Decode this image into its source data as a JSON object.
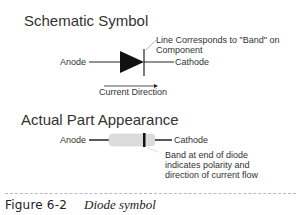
{
  "schematic": {
    "title": "Schematic Symbol",
    "anode_label": "Anode",
    "cathode_label": "Cathode",
    "band_note_line1": "Line Corresponds to \"Band\" on",
    "band_note_line2": "Component",
    "current_label": "Current Direction"
  },
  "actual": {
    "title": "Actual Part Appearance",
    "anode_label": "Anode",
    "cathode_label": "Cathode",
    "band_note_line1": "Band at end of diode",
    "band_note_line2": "indicates polarity and",
    "band_note_line3": "direction of current flow"
  },
  "caption": {
    "label": "Figure 6-2",
    "text": "Diode symbol"
  },
  "colors": {
    "line": "#222222",
    "body": "#dcdcdc",
    "band": "#111111",
    "leader": "#aaaaaa"
  }
}
